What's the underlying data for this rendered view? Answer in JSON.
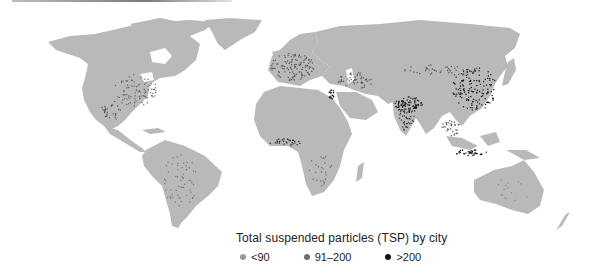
{
  "chart_data": {
    "type": "map",
    "title": "Total suspended particles (TSP) by city",
    "basemap": "world",
    "land_color": "#b9b9b9",
    "legend": [
      {
        "label": "<90",
        "color": "#9a9a9a",
        "class": "low"
      },
      {
        "label": "91–200",
        "color": "#6e6e6e",
        "class": "medium"
      },
      {
        "label": ">200",
        "color": "#111111",
        "class": "high"
      }
    ],
    "regions_high_density": [
      "Eastern China",
      "Northern India",
      "Nile Delta (Egypt)",
      "Java (Indonesia)",
      "West Africa coast"
    ],
    "regions_medium_density": [
      "Europe",
      "Eastern United States",
      "Middle East",
      "Southeast Asia",
      "Central Asia"
    ],
    "regions_low_density": [
      "South America",
      "Canada",
      "Australia",
      "Southern Africa",
      "Russia"
    ]
  },
  "legend": {
    "title": "Total suspended particles (TSP) by city",
    "items": [
      {
        "label": "<90",
        "color": "#9a9a9a"
      },
      {
        "label": "91–200",
        "color": "#6e6e6e"
      },
      {
        "label": ">200",
        "color": "#111111"
      }
    ]
  }
}
